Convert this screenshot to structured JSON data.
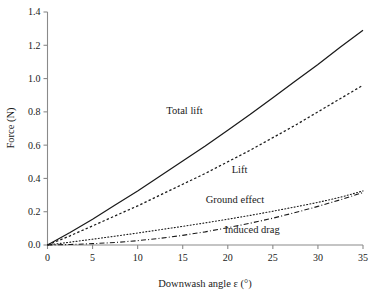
{
  "chart_data": {
    "type": "line",
    "title": "",
    "xlabel": "Downwash angle ε (°)",
    "ylabel": "Force (N)",
    "xlim": [
      0,
      35
    ],
    "ylim": [
      0.0,
      1.4
    ],
    "xticks": [
      "0",
      "5",
      "10",
      "15",
      "20",
      "25",
      "30",
      "35"
    ],
    "xtick_values": [
      0,
      5,
      10,
      15,
      20,
      25,
      30,
      35
    ],
    "yticks": [
      "0.0",
      "0.2",
      "0.4",
      "0.6",
      "0.8",
      "1.0",
      "1.2",
      "1.4"
    ],
    "ytick_values": [
      0.0,
      0.2,
      0.4,
      0.6,
      0.8,
      1.0,
      1.2,
      1.4
    ],
    "grid": false,
    "legend_position": "inline-annotations",
    "x": [
      0,
      2.5,
      5,
      7.5,
      10,
      12.5,
      15,
      17.5,
      20,
      22.5,
      25,
      27.5,
      30,
      32.5,
      35
    ],
    "series": [
      {
        "name": "Total lift",
        "style": "solid",
        "values": [
          0.0,
          0.075,
          0.155,
          0.24,
          0.325,
          0.415,
          0.505,
          0.595,
          0.69,
          0.785,
          0.885,
          0.985,
          1.085,
          1.19,
          1.29
        ]
      },
      {
        "name": "Lift",
        "style": "dashed",
        "values": [
          0.0,
          0.055,
          0.115,
          0.175,
          0.235,
          0.3,
          0.365,
          0.43,
          0.5,
          0.57,
          0.645,
          0.72,
          0.8,
          0.88,
          0.96
        ]
      },
      {
        "name": "Ground effect",
        "style": "dotted",
        "values": [
          0.0,
          0.017,
          0.035,
          0.053,
          0.072,
          0.092,
          0.112,
          0.133,
          0.155,
          0.178,
          0.203,
          0.229,
          0.256,
          0.287,
          0.325
        ]
      },
      {
        "name": "Induced drag",
        "style": "dash-dot",
        "values": [
          0.0,
          0.003,
          0.008,
          0.015,
          0.026,
          0.04,
          0.058,
          0.079,
          0.104,
          0.131,
          0.161,
          0.195,
          0.232,
          0.272,
          0.315
        ]
      }
    ],
    "annotations": [
      {
        "text": "Total lift",
        "x": 15.2,
        "y": 0.79
      },
      {
        "text": "Lift",
        "x": 21.3,
        "y": 0.435
      },
      {
        "text": "Ground effect",
        "x": 20.8,
        "y": 0.255
      },
      {
        "text": "Induced drag",
        "x": 22.7,
        "y": 0.075
      }
    ],
    "colors": {
      "line": "#1a1a1a",
      "axis": "#8a8a8a",
      "background": "#ffffff"
    }
  }
}
